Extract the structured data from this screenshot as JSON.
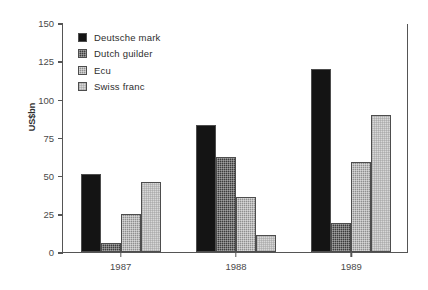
{
  "chart_data": {
    "type": "bar",
    "title": "",
    "xlabel": "",
    "ylabel": "US$bn",
    "categories": [
      "1987",
      "1988",
      "1989"
    ],
    "ylim": [
      0,
      150
    ],
    "yticks": [
      0,
      25,
      50,
      75,
      100,
      125,
      150
    ],
    "grid": false,
    "legend_position": "top-left",
    "series": [
      {
        "name": "Deutsche mark",
        "color": "#141414",
        "values": [
          51,
          83,
          120
        ]
      },
      {
        "name": "Dutch guilder",
        "color": "#3c3c3c",
        "values": [
          6,
          62,
          19
        ]
      },
      {
        "name": "Ecu",
        "color": "#8f8f8f",
        "values": [
          25,
          36,
          59
        ]
      },
      {
        "name": "Swiss franc",
        "color": "#d8d8d8",
        "values": [
          46,
          11,
          90
        ]
      }
    ]
  }
}
